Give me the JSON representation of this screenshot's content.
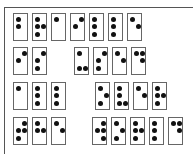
{
  "diagram": {
    "type": "braille-cells",
    "dot_numbering": "1,2,3 = left column top-to-bottom; 4,5,6 = right column top-to-bottom",
    "colors": {
      "dot": "#111111",
      "cell_border": "#666666",
      "frame": "#555555",
      "background": "#ffffff"
    },
    "rows": [
      {
        "y": 13,
        "groups": [
          {
            "x": 13,
            "cells": [
              [
                1,
                2
              ],
              [
                1,
                2,
                3,
                5
              ],
              [
                1
              ],
              [
                2,
                4
              ],
              [
                1,
                2,
                3
              ],
              [
                1,
                2,
                3
              ],
              [
                1,
                5
              ]
            ]
          }
        ]
      },
      {
        "y": 47,
        "groups": [
          {
            "x": 13,
            "cells": [
              [
                2,
                4
              ],
              [
                2,
                3,
                4
              ]
            ]
          },
          {
            "x": 74,
            "cells": [
              [
                1,
                3,
                6
              ],
              [
                2,
                3,
                4
              ],
              [
                1,
                5
              ],
              [
                1,
                4,
                5
              ]
            ]
          }
        ]
      },
      {
        "y": 82,
        "groups": [
          {
            "x": 13,
            "cells": [
              [
                1
              ],
              [
                1,
                2,
                3
              ],
              [
                1,
                2,
                3
              ]
            ]
          },
          {
            "x": 95,
            "cells": [
              [
                1,
                3,
                5
              ],
              [
                1,
                2,
                3,
                6
              ],
              [
                1,
                5
              ],
              [
                1,
                2,
                3,
                5
              ]
            ]
          }
        ]
      },
      {
        "y": 117,
        "groups": [
          {
            "x": 13,
            "cells": [
              [
                2,
                3,
                4,
                5
              ],
              [
                1,
                2,
                5
              ],
              [
                1,
                5
              ]
            ]
          },
          {
            "x": 92,
            "cells": [
              [
                2,
                4,
                5,
                6
              ],
              [
                1,
                3,
                5
              ],
              [
                1,
                2,
                3,
                5
              ],
              [
                1,
                2,
                3
              ],
              [
                1,
                4,
                5
              ]
            ]
          }
        ]
      }
    ],
    "cell_step_px": 19
  }
}
